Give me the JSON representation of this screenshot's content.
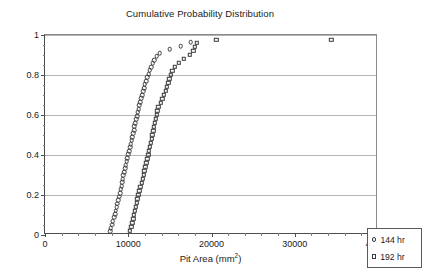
{
  "chart_data": {
    "type": "scatter",
    "title": "Cumulative Probability Distribution",
    "xlabel_text": "Pit Area (mm",
    "xlabel_sup": "2",
    "xlabel_tail": ")",
    "ylabel": "",
    "xlim": [
      0,
      40000
    ],
    "ylim": [
      0,
      1
    ],
    "grid": "horizontal",
    "legend_position": "bottom-right",
    "xticks": [
      0,
      10000,
      20000,
      30000,
      40000
    ],
    "xtick_labels": [
      "0",
      "10000",
      "20000",
      "30000",
      "40000"
    ],
    "xminor_step": 2000,
    "yticks": [
      0,
      0.2,
      0.4,
      0.6,
      0.8,
      1
    ],
    "ytick_labels": [
      "0",
      "0.2",
      "0.4",
      "0.6",
      "0.8",
      "1"
    ],
    "yminor_step": 0.05,
    "marker_edge_color": "#3a3a3a",
    "gridline_color": "#b3b3b3",
    "axis_color": "#4d4d4d",
    "series": [
      {
        "name": "144 hr",
        "marker": "circle",
        "points": [
          [
            7800,
            0.018
          ],
          [
            7900,
            0.035
          ],
          [
            8050,
            0.052
          ],
          [
            8150,
            0.07
          ],
          [
            8300,
            0.088
          ],
          [
            8400,
            0.105
          ],
          [
            8500,
            0.122
          ],
          [
            8600,
            0.14
          ],
          [
            8700,
            0.157
          ],
          [
            8800,
            0.175
          ],
          [
            8900,
            0.192
          ],
          [
            9000,
            0.21
          ],
          [
            9100,
            0.228
          ],
          [
            9200,
            0.245
          ],
          [
            9300,
            0.263
          ],
          [
            9350,
            0.28
          ],
          [
            9400,
            0.298
          ],
          [
            9500,
            0.315
          ],
          [
            9600,
            0.333
          ],
          [
            9700,
            0.35
          ],
          [
            9800,
            0.368
          ],
          [
            9900,
            0.385
          ],
          [
            10000,
            0.403
          ],
          [
            10100,
            0.42
          ],
          [
            10200,
            0.438
          ],
          [
            10300,
            0.455
          ],
          [
            10400,
            0.473
          ],
          [
            10500,
            0.49
          ],
          [
            10600,
            0.508
          ],
          [
            10700,
            0.525
          ],
          [
            10750,
            0.543
          ],
          [
            10850,
            0.56
          ],
          [
            10950,
            0.578
          ],
          [
            11050,
            0.595
          ],
          [
            11150,
            0.613
          ],
          [
            11250,
            0.63
          ],
          [
            11350,
            0.648
          ],
          [
            11450,
            0.665
          ],
          [
            11550,
            0.683
          ],
          [
            11650,
            0.7
          ],
          [
            11800,
            0.718
          ],
          [
            11900,
            0.735
          ],
          [
            12000,
            0.753
          ],
          [
            12150,
            0.77
          ],
          [
            12300,
            0.788
          ],
          [
            12450,
            0.805
          ],
          [
            12600,
            0.823
          ],
          [
            12750,
            0.84
          ],
          [
            12950,
            0.858
          ],
          [
            13150,
            0.875
          ],
          [
            13400,
            0.893
          ],
          [
            13800,
            0.91
          ],
          [
            15000,
            0.928
          ],
          [
            16300,
            0.945
          ],
          [
            17500,
            0.963
          ]
        ]
      },
      {
        "name": "192 hr",
        "marker": "square",
        "points": [
          [
            10200,
            0.02
          ],
          [
            10350,
            0.04
          ],
          [
            10500,
            0.06
          ],
          [
            10600,
            0.08
          ],
          [
            10700,
            0.1
          ],
          [
            10800,
            0.12
          ],
          [
            10900,
            0.14
          ],
          [
            11000,
            0.16
          ],
          [
            11100,
            0.18
          ],
          [
            11200,
            0.2
          ],
          [
            11350,
            0.22
          ],
          [
            11450,
            0.24
          ],
          [
            11600,
            0.26
          ],
          [
            11750,
            0.28
          ],
          [
            11850,
            0.3
          ],
          [
            11950,
            0.32
          ],
          [
            12050,
            0.34
          ],
          [
            12150,
            0.36
          ],
          [
            12300,
            0.38
          ],
          [
            12400,
            0.4
          ],
          [
            12500,
            0.42
          ],
          [
            12600,
            0.44
          ],
          [
            12700,
            0.46
          ],
          [
            12800,
            0.48
          ],
          [
            12900,
            0.5
          ],
          [
            13000,
            0.52
          ],
          [
            13100,
            0.54
          ],
          [
            13200,
            0.56
          ],
          [
            13300,
            0.58
          ],
          [
            13400,
            0.6
          ],
          [
            13500,
            0.62
          ],
          [
            13600,
            0.64
          ],
          [
            13900,
            0.66
          ],
          [
            14100,
            0.68
          ],
          [
            14300,
            0.7
          ],
          [
            14500,
            0.72
          ],
          [
            14650,
            0.74
          ],
          [
            14800,
            0.76
          ],
          [
            14950,
            0.78
          ],
          [
            15100,
            0.8
          ],
          [
            15300,
            0.82
          ],
          [
            15600,
            0.84
          ],
          [
            16100,
            0.86
          ],
          [
            16700,
            0.88
          ],
          [
            17400,
            0.9
          ],
          [
            17800,
            0.92
          ],
          [
            18000,
            0.94
          ],
          [
            18200,
            0.96
          ],
          [
            20600,
            0.975
          ],
          [
            34400,
            0.975
          ]
        ]
      }
    ]
  },
  "legend": {
    "items": [
      {
        "label": "144 hr",
        "marker": "circle"
      },
      {
        "label": "192 hr",
        "marker": "square"
      }
    ]
  }
}
